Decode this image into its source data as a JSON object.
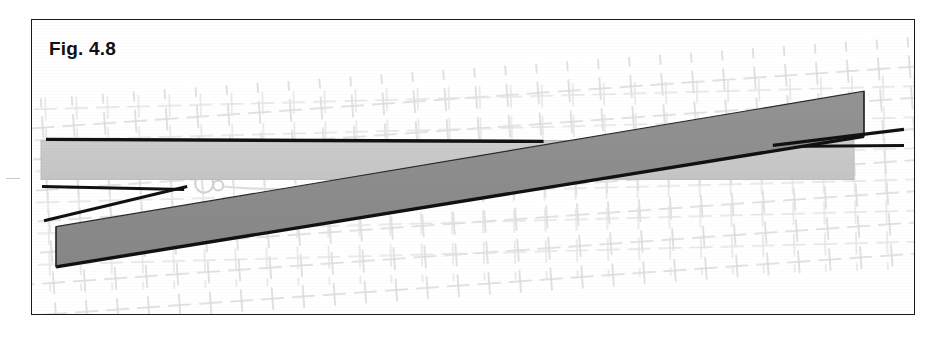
{
  "figure": {
    "label": "Fig. 4.8",
    "frame": {
      "x": 31,
      "y": 19,
      "width": 884,
      "height": 296,
      "border_color": "#1a1a1a",
      "background_color": "#ffffff"
    },
    "background_grid": {
      "name": "cross-hatch-grid",
      "mark": "plus",
      "color": "#d9d9d9",
      "rotation_deg": -4,
      "spacing_x": 31,
      "spacing_y": 31,
      "arm_length": 11,
      "description": "faint light-gray grid of small plus/cross marks filling the middle band of the figure"
    },
    "shapes": [
      {
        "name": "light-gray-horizontal-bar",
        "type": "rectangle",
        "fill": "#c8c8c8",
        "stroke": "#b4b4b4",
        "points": "9,120 821,120 821,159 9,159",
        "description": "pale gray horizontal bar spanning the full width"
      },
      {
        "name": "dark-gray-diagonal-bar",
        "type": "parallelogram",
        "fill": "#8d8d8d",
        "stroke": "#1a1a1a",
        "points": "24,206 831,71 831,116 24,246",
        "description": "mid-gray diagonal bar with black outline rising left-to-right"
      }
    ],
    "lines": [
      {
        "name": "top-edge-black-line",
        "color": "#111111",
        "width": 3.4,
        "x1": 14,
        "y1": 119,
        "x2": 511,
        "y2": 121
      },
      {
        "name": "lower-left-black-line-upper",
        "color": "#111111",
        "width": 3.0,
        "x1": 10,
        "y1": 166,
        "x2": 152,
        "y2": 169
      },
      {
        "name": "lower-left-black-line-lower",
        "color": "#111111",
        "width": 3.0,
        "x1": 12,
        "y1": 200,
        "x2": 155,
        "y2": 166
      },
      {
        "name": "right-black-line-upper",
        "color": "#111111",
        "width": 3.2,
        "x1": 740,
        "y1": 125,
        "x2": 871,
        "y2": 109
      },
      {
        "name": "right-black-line-lower",
        "color": "#111111",
        "width": 3.0,
        "x1": 742,
        "y1": 126,
        "x2": 871,
        "y2": 125
      }
    ],
    "details": [
      {
        "name": "faint-circular-loop",
        "color": "#d2d2d2",
        "cx": 172,
        "cy": 163,
        "r": 9,
        "description": "faint light-gray circular loop detail overlapping the grid near center-left"
      },
      {
        "name": "faint-circular-loop-small",
        "color": "#d2d2d2",
        "cx": 186,
        "cy": 165,
        "r": 5
      }
    ],
    "colors": {
      "light_bar": "#c8c8c8",
      "dark_bar": "#8d8d8d",
      "outline": "#111111",
      "grid": "#d9d9d9",
      "page": "#ffffff"
    }
  }
}
